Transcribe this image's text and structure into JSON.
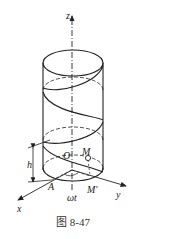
{
  "figure": {
    "caption": "图 8-47"
  },
  "axes": {
    "z_label": "z",
    "x_label": "x",
    "y_label": "y"
  },
  "points": {
    "origin": "O",
    "m": "M",
    "m_prime": "M'",
    "a": "A"
  },
  "annotations": {
    "height": "h",
    "angle": "ωt"
  },
  "colors": {
    "stroke": "#222222",
    "background": "#ffffff"
  }
}
